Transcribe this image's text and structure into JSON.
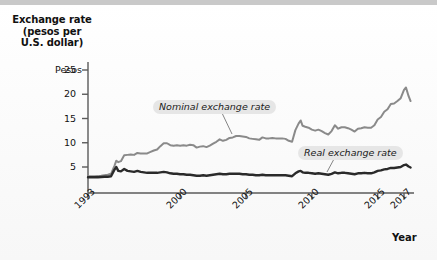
{
  "figure": {
    "background_color": "#fbfbfb",
    "top_bar_color": "#c9c9c9"
  },
  "axis_titles": {
    "y_title": "Exchange rate\n(pesos per\nU.S. dollar)",
    "y_title_line1": "Exchange rate",
    "y_title_line2": "(pesos per",
    "y_title_line3": "U.S. dollar)",
    "y_unit_label": "Pesos",
    "x_title": "Year"
  },
  "annotations": [
    {
      "id": "nominal",
      "text": "Nominal exchange rate",
      "color": "#8a8a8a"
    },
    {
      "id": "real",
      "text": "Real exchange rate",
      "color": "#2a2a2a"
    }
  ],
  "chart_data": {
    "type": "line",
    "title": "Exchange rate (pesos per U.S. dollar)",
    "xlabel": "Year",
    "ylabel": "Exchange rate (pesos per U.S. dollar)",
    "y_unit_prefix": "Pesos",
    "xlim": [
      1993,
      2017.6
    ],
    "ylim": [
      0,
      26.5
    ],
    "yticks": [
      5,
      10,
      15,
      20,
      25
    ],
    "ytick_labels": [
      "5",
      "10",
      "15",
      "20",
      "25"
    ],
    "xticks": [
      1993,
      2000,
      2005,
      2010,
      2015,
      2017
    ],
    "xtick_labels": [
      "1993",
      "2000",
      "2005",
      "2010",
      "2015",
      "2017"
    ],
    "grid": false,
    "legend_position": "inline-annotations",
    "series": [
      {
        "name": "Nominal exchange rate",
        "color": "#8a8a8a",
        "line_width": 2.0,
        "x": [
          1993.0,
          1993.25,
          1993.5,
          1993.75,
          1994.0,
          1994.25,
          1994.5,
          1994.75,
          1995.0,
          1995.15,
          1995.3,
          1995.5,
          1995.75,
          1996.0,
          1996.25,
          1996.5,
          1996.75,
          1997.0,
          1997.25,
          1997.5,
          1997.75,
          1998.0,
          1998.25,
          1998.5,
          1998.75,
          1999.0,
          1999.25,
          1999.5,
          1999.75,
          2000.0,
          2000.25,
          2000.5,
          2000.75,
          2001.0,
          2001.25,
          2001.5,
          2001.75,
          2002.0,
          2002.25,
          2002.5,
          2002.75,
          2003.0,
          2003.25,
          2003.5,
          2003.75,
          2004.0,
          2004.25,
          2004.5,
          2004.75,
          2005.0,
          2005.25,
          2005.5,
          2005.75,
          2006.0,
          2006.25,
          2006.5,
          2006.75,
          2007.0,
          2007.25,
          2007.5,
          2007.75,
          2008.0,
          2008.25,
          2008.5,
          2008.75,
          2009.0,
          2009.15,
          2009.3,
          2009.5,
          2009.75,
          2010.0,
          2010.25,
          2010.5,
          2010.75,
          2011.0,
          2011.25,
          2011.5,
          2011.75,
          2012.0,
          2012.25,
          2012.5,
          2012.75,
          2013.0,
          2013.25,
          2013.5,
          2013.75,
          2014.0,
          2014.25,
          2014.5,
          2014.75,
          2015.0,
          2015.25,
          2015.5,
          2015.75,
          2016.0,
          2016.25,
          2016.5,
          2016.75,
          2017.0,
          2017.15,
          2017.35,
          2017.5
        ],
        "values": [
          3.1,
          3.1,
          3.1,
          3.12,
          3.2,
          3.3,
          3.4,
          3.6,
          5.2,
          6.3,
          6.0,
          6.2,
          7.4,
          7.5,
          7.6,
          7.5,
          7.9,
          7.8,
          7.8,
          7.8,
          8.1,
          8.4,
          8.6,
          9.3,
          9.9,
          9.9,
          9.5,
          9.4,
          9.5,
          9.4,
          9.5,
          9.4,
          9.6,
          9.5,
          9.0,
          9.2,
          9.3,
          9.1,
          9.4,
          9.8,
          10.2,
          10.7,
          10.4,
          10.6,
          11.0,
          11.1,
          11.4,
          11.4,
          11.3,
          11.2,
          10.9,
          10.8,
          10.7,
          10.6,
          11.1,
          10.9,
          10.9,
          11.0,
          10.9,
          10.9,
          10.9,
          10.8,
          10.4,
          10.2,
          12.6,
          14.0,
          14.6,
          13.5,
          13.3,
          13.1,
          12.7,
          12.5,
          12.7,
          12.4,
          12.0,
          11.7,
          12.4,
          13.6,
          12.9,
          13.2,
          13.2,
          13.0,
          12.7,
          12.3,
          12.9,
          13.0,
          13.2,
          13.1,
          13.1,
          13.6,
          14.8,
          15.3,
          16.4,
          16.9,
          18.0,
          18.1,
          18.6,
          19.2,
          20.9,
          21.4,
          19.6,
          18.6
        ]
      },
      {
        "name": "Real exchange rate",
        "color": "#2a2a2a",
        "line_width": 2.4,
        "x": [
          1993.0,
          1993.25,
          1993.5,
          1993.75,
          1994.0,
          1994.25,
          1994.5,
          1994.75,
          1995.0,
          1995.15,
          1995.3,
          1995.5,
          1995.75,
          1996.0,
          1996.25,
          1996.5,
          1996.75,
          1997.0,
          1997.25,
          1997.5,
          1997.75,
          1998.0,
          1998.25,
          1998.5,
          1998.75,
          1999.0,
          1999.25,
          1999.5,
          1999.75,
          2000.0,
          2000.25,
          2000.5,
          2000.75,
          2001.0,
          2001.25,
          2001.5,
          2001.75,
          2002.0,
          2002.25,
          2002.5,
          2002.75,
          2003.0,
          2003.25,
          2003.5,
          2003.75,
          2004.0,
          2004.25,
          2004.5,
          2004.75,
          2005.0,
          2005.25,
          2005.5,
          2005.75,
          2006.0,
          2006.25,
          2006.5,
          2006.75,
          2007.0,
          2007.25,
          2007.5,
          2007.75,
          2008.0,
          2008.25,
          2008.5,
          2008.75,
          2009.0,
          2009.15,
          2009.3,
          2009.5,
          2009.75,
          2010.0,
          2010.25,
          2010.5,
          2010.75,
          2011.0,
          2011.25,
          2011.5,
          2011.75,
          2012.0,
          2012.25,
          2012.5,
          2012.75,
          2013.0,
          2013.25,
          2013.5,
          2013.75,
          2014.0,
          2014.25,
          2014.5,
          2014.75,
          2015.0,
          2015.25,
          2015.5,
          2015.75,
          2016.0,
          2016.25,
          2016.5,
          2016.75,
          2017.0,
          2017.15,
          2017.35,
          2017.5
        ],
        "values": [
          2.9,
          2.9,
          2.9,
          2.9,
          2.95,
          3.0,
          3.0,
          3.1,
          4.4,
          5.0,
          4.2,
          4.1,
          4.6,
          4.2,
          4.1,
          4.0,
          4.2,
          4.0,
          3.9,
          3.8,
          3.8,
          3.8,
          3.8,
          3.9,
          4.0,
          3.9,
          3.7,
          3.6,
          3.6,
          3.5,
          3.5,
          3.4,
          3.4,
          3.3,
          3.2,
          3.2,
          3.3,
          3.2,
          3.3,
          3.4,
          3.5,
          3.6,
          3.5,
          3.5,
          3.6,
          3.6,
          3.6,
          3.6,
          3.5,
          3.5,
          3.4,
          3.4,
          3.3,
          3.3,
          3.4,
          3.3,
          3.3,
          3.3,
          3.3,
          3.3,
          3.3,
          3.3,
          3.2,
          3.1,
          3.7,
          4.1,
          4.2,
          3.9,
          3.8,
          3.8,
          3.7,
          3.6,
          3.7,
          3.6,
          3.5,
          3.4,
          3.6,
          3.9,
          3.7,
          3.8,
          3.8,
          3.7,
          3.6,
          3.5,
          3.7,
          3.7,
          3.8,
          3.7,
          3.7,
          3.9,
          4.2,
          4.3,
          4.5,
          4.6,
          4.8,
          4.8,
          4.9,
          5.0,
          5.4,
          5.5,
          5.1,
          4.9
        ]
      }
    ]
  }
}
